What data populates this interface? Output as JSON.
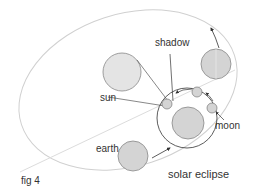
{
  "figure": {
    "caption": "fig 4",
    "title": "solar eclipse"
  },
  "labels": {
    "shadow": "shadow",
    "sun": "sun",
    "moon": "moon",
    "earth": "earth"
  },
  "colors": {
    "orbit_line": "#d0d0d0",
    "body_fill": "#d4d4d4",
    "sun_fill": "#e4e4e4",
    "outline": "#888888",
    "arrow": "#333333",
    "text": "#333333"
  }
}
